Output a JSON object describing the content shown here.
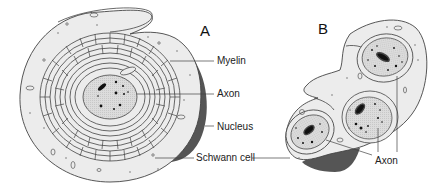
{
  "figure": {
    "panels": [
      {
        "id": "A",
        "label": "A",
        "description": "Cross-section of a myelinated nerve fiber: Schwann cell wrapped in concentric myelin layers around a single axon",
        "callouts": [
          "Myelin",
          "Axon",
          "Nucleus",
          "Schwann cell"
        ]
      },
      {
        "id": "B",
        "label": "B",
        "description": "Cross-section of unmyelinated nerve fibers: several axons embedded in a single Schwann cell",
        "callouts": [
          "Axon"
        ]
      }
    ],
    "labels": {
      "panel_a": "A",
      "panel_b": "B",
      "myelin": "Myelin",
      "axon_a": "Axon",
      "nucleus": "Nucleus",
      "schwann_cell": "Schwann cell",
      "axon_b": "Axon"
    },
    "colors": {
      "cytoplasm": "#ececec",
      "axoplasm": "#d9d9d9",
      "nucleus": "#555555",
      "outline": "#444444",
      "text": "#222222"
    }
  }
}
